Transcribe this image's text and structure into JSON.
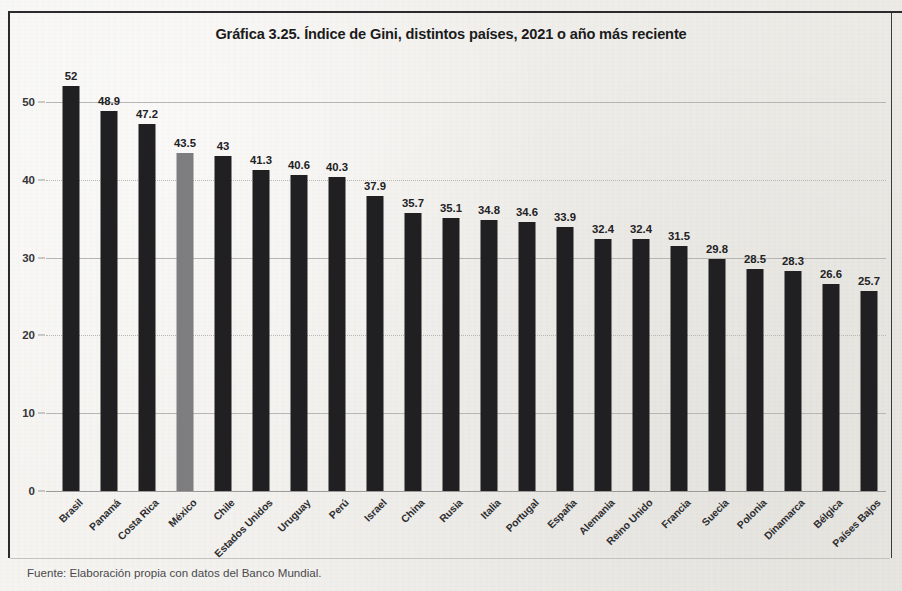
{
  "document": {
    "title": "Gráfica 3.25. Índice de Gini, distintos países, 2021 o año más reciente",
    "source_note": "Fuente: Elaboración propia con datos del Banco Mundial."
  },
  "colors": {
    "bar": "#201f21",
    "highlight_bar": "#7e7e80",
    "paper": "#f3f1ee",
    "frame": "#2a2a2c",
    "gridline": "#b9b7b4",
    "text": "#1b1b1d"
  },
  "chart_data": {
    "type": "bar",
    "title": "Gráfica 3.25. Índice de Gini, distintos países, 2021 o año más reciente",
    "xlabel": "",
    "ylabel": "",
    "ylim": [
      0,
      55
    ],
    "yticks": [
      0,
      10,
      20,
      30,
      40,
      50
    ],
    "ytick_labels": [
      "0",
      "10",
      "20",
      "30",
      "40",
      "50"
    ],
    "grid": true,
    "legend": null,
    "highlight_category": "México",
    "categories": [
      "Brasil",
      "Panamá",
      "Costa Rica",
      "México",
      "Chile",
      "Estados Unidos",
      "Uruguay",
      "Perú",
      "Israel",
      "China",
      "Rusia",
      "Italia",
      "Portugal",
      "España",
      "Alemania",
      "Reino Unido",
      "Francia",
      "Suecia",
      "Polonia",
      "Dinamarca",
      "Bélgica",
      "Países Bajos"
    ],
    "values": [
      52,
      48.9,
      47.2,
      43.5,
      43,
      41.3,
      40.6,
      40.3,
      37.9,
      35.7,
      35.1,
      34.8,
      34.6,
      33.9,
      32.4,
      32.4,
      31.5,
      29.8,
      28.5,
      28.3,
      26.6,
      25.7
    ],
    "value_labels": [
      "52",
      "48.9",
      "47.2",
      "43.5",
      "43",
      "41.3",
      "40.6",
      "40.3",
      "37.9",
      "35.7",
      "35.1",
      "34.8",
      "34.6",
      "33.9",
      "32.4",
      "32.4",
      "31.5",
      "29.8",
      "28.5",
      "28.3",
      "26.6",
      "25.7"
    ]
  }
}
